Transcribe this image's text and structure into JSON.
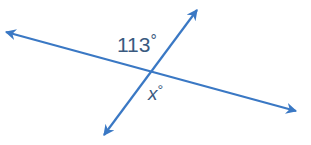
{
  "diagram": {
    "type": "intersecting-lines",
    "line_color": "#3a78c4",
    "label_color": "#3a5a80",
    "lines": [
      {
        "name": "line-a",
        "from": [
          6,
          32
        ],
        "to": [
          296,
          111
        ],
        "arrows": "both"
      },
      {
        "name": "line-b",
        "from": [
          104,
          135
        ],
        "to": [
          197,
          10
        ],
        "arrows": "both"
      }
    ],
    "intersection": [
      151,
      74
    ],
    "labels": {
      "known_angle": {
        "value": "113",
        "unit": "°"
      },
      "unknown_angle": {
        "value": "x",
        "unit": "°"
      }
    }
  }
}
